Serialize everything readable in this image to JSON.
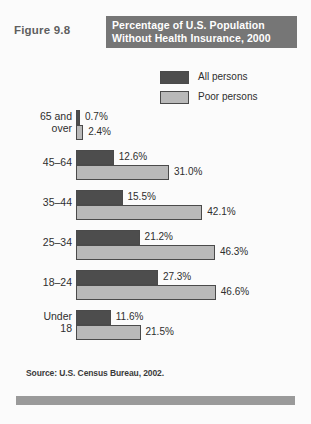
{
  "figure": {
    "number_label": "Figure 9.8",
    "title_line_1": "Percentage of U.S. Population",
    "title_line_2": "Without Health Insurance, 2000",
    "source": "Source: U.S. Census Bureau, 2002."
  },
  "legend": {
    "entries": [
      {
        "label": "All persons",
        "color": "#4d4d4d"
      },
      {
        "label": "Poor persons",
        "color": "#b9b9b9"
      }
    ]
  },
  "chart_data": {
    "type": "bar",
    "orientation": "horizontal",
    "title": "Percentage of U.S. Population Without Health Insurance, 2000",
    "xlabel": "",
    "ylabel": "",
    "xlim": [
      0,
      50
    ],
    "grid": false,
    "legend_position": "top-right",
    "value_suffix": "%",
    "categories": [
      "65 and over",
      "45-64",
      "35-44",
      "25-34",
      "18-24",
      "Under 18"
    ],
    "category_lines": [
      [
        "65 and",
        "over"
      ],
      [
        "45–64",
        ""
      ],
      [
        "35–44",
        ""
      ],
      [
        "25–34",
        ""
      ],
      [
        "18–24",
        ""
      ],
      [
        "Under",
        "18"
      ]
    ],
    "series": [
      {
        "name": "All persons",
        "color": "#4d4d4d",
        "values": [
          0.7,
          12.6,
          15.5,
          21.2,
          27.3,
          11.6
        ],
        "labels": [
          "0.7%",
          "12.6%",
          "15.5%",
          "21.2%",
          "27.3%",
          "11.6%"
        ]
      },
      {
        "name": "Poor persons",
        "color": "#b9b9b9",
        "values": [
          2.4,
          31.0,
          42.1,
          46.3,
          46.6,
          21.5
        ],
        "labels": [
          "2.4%",
          "31.0%",
          "42.1%",
          "46.3%",
          "46.6%",
          "21.5%"
        ]
      }
    ]
  }
}
